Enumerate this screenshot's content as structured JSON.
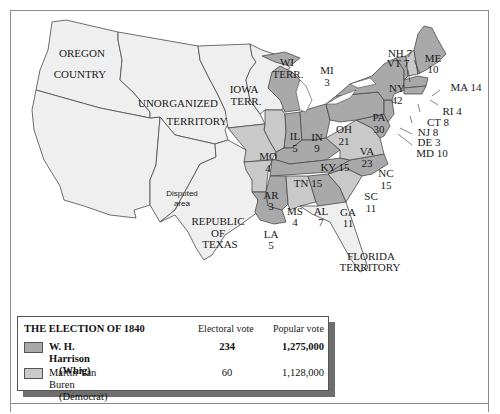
{
  "map": {
    "title": "The Election of 1840",
    "colors": {
      "harrison": "#a9a9a9",
      "van_buren": "#c9c9c9",
      "territory": "#efefef",
      "outline": "#4a4a4a",
      "water": "#ffffff"
    },
    "region_labels": {
      "oregon_line1": "OREGON",
      "oregon_line2": "COUNTRY",
      "unorganized_line1": "UNORGANIZED",
      "unorganized_line2": "TERRITORY",
      "iowa_line1": "IOWA",
      "iowa_line2": "TERR.",
      "wi_line1": "WI",
      "wi_line2": "TERR.",
      "disputed_line1": "Disputed",
      "disputed_line2": "area",
      "texas_line1": "REPUBLIC",
      "texas_line2": "OF",
      "texas_line3": "TEXAS",
      "florida_line1": "FLORIDA",
      "florida_line2": "TERRITORY"
    },
    "states": [
      {
        "abbr": "ME",
        "votes": "10",
        "winner": "harrison"
      },
      {
        "abbr": "NH",
        "votes": "7",
        "winner": "van_buren",
        "label": "NH 7"
      },
      {
        "abbr": "VT",
        "votes": "7",
        "winner": "harrison",
        "label": "VT 7"
      },
      {
        "abbr": "MA",
        "votes": "14",
        "winner": "harrison",
        "label": "MA 14"
      },
      {
        "abbr": "RI",
        "votes": "4",
        "winner": "harrison",
        "label": "RI 4"
      },
      {
        "abbr": "CT",
        "votes": "8",
        "winner": "harrison",
        "label": "CT 8"
      },
      {
        "abbr": "NY",
        "votes": "42",
        "winner": "harrison"
      },
      {
        "abbr": "NJ",
        "votes": "8",
        "winner": "harrison",
        "label": "NJ 8"
      },
      {
        "abbr": "PA",
        "votes": "30",
        "winner": "harrison"
      },
      {
        "abbr": "DE",
        "votes": "3",
        "winner": "harrison",
        "label": "DE 3"
      },
      {
        "abbr": "MD",
        "votes": "10",
        "winner": "harrison",
        "label": "MD 10"
      },
      {
        "abbr": "VA",
        "votes": "23",
        "winner": "van_buren"
      },
      {
        "abbr": "NC",
        "votes": "15",
        "winner": "harrison"
      },
      {
        "abbr": "SC",
        "votes": "11",
        "winner": "van_buren"
      },
      {
        "abbr": "GA",
        "votes": "11",
        "winner": "harrison"
      },
      {
        "abbr": "AL",
        "votes": "7",
        "winner": "van_buren"
      },
      {
        "abbr": "MS",
        "votes": "4",
        "winner": "harrison"
      },
      {
        "abbr": "LA",
        "votes": "5",
        "winner": "harrison"
      },
      {
        "abbr": "TN",
        "votes": "15",
        "winner": "harrison",
        "label": "TN 15"
      },
      {
        "abbr": "KY",
        "votes": "15",
        "winner": "harrison",
        "label": "KY 15"
      },
      {
        "abbr": "OH",
        "votes": "21",
        "winner": "harrison"
      },
      {
        "abbr": "IN",
        "votes": "9",
        "winner": "harrison"
      },
      {
        "abbr": "IL",
        "votes": "5",
        "winner": "van_buren"
      },
      {
        "abbr": "MI",
        "votes": "3",
        "winner": "harrison"
      },
      {
        "abbr": "MO",
        "votes": "4",
        "winner": "van_buren"
      },
      {
        "abbr": "AR",
        "votes": "3",
        "winner": "van_buren"
      }
    ]
  },
  "legend": {
    "title": "THE ELECTION OF 1840",
    "col_electoral": "Electoral vote",
    "col_popular": "Popular vote",
    "rows": [
      {
        "name": "W. H. Harrison",
        "party": "(Whig)",
        "electoral": "234",
        "popular": "1,275,000",
        "color": "#a9a9a9",
        "bold": true
      },
      {
        "name": "Martin Van Buren",
        "party": "(Democrat)",
        "electoral": "60",
        "popular": "1,128,000",
        "color": "#c9c9c9",
        "bold": false
      }
    ]
  }
}
